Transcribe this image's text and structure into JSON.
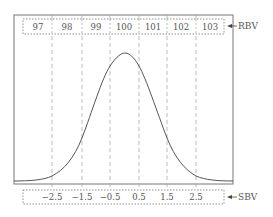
{
  "diagram": {
    "type": "normal-distribution-scale-conversion",
    "top_scale": {
      "label": "RBV",
      "values": [
        "97",
        "98",
        "99",
        "100",
        "101",
        "102",
        "103"
      ]
    },
    "bottom_scale": {
      "label": "SBV",
      "values": [
        "−2.5",
        "−1.5",
        "−0.5",
        "0.5",
        "1.5",
        "2.5"
      ]
    },
    "curve": "bell-curve",
    "colors": {
      "line": "#555555",
      "dashed": "#aaaaaa",
      "frame": "#777777"
    }
  }
}
